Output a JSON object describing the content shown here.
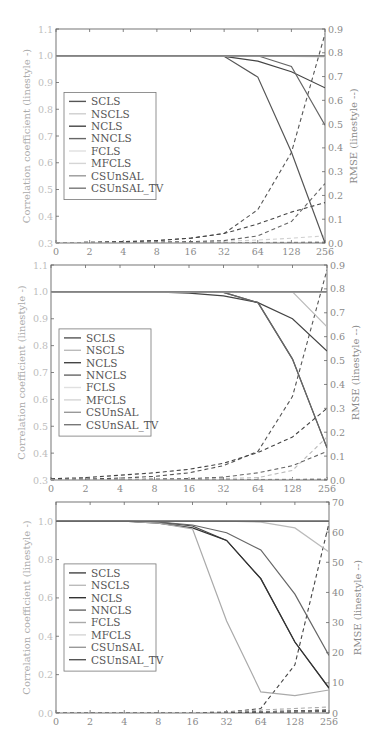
{
  "chart_data": [
    {
      "type": "line",
      "panel": 1,
      "x": [
        "0",
        "2",
        "4",
        "8",
        "16",
        "32",
        "64",
        "128",
        "256"
      ],
      "xlabel": "",
      "ylabel": "Correlation coefficient (linestyle -)",
      "ylim": [
        0.3,
        1.1
      ],
      "yticks": [
        "0.3",
        "0.4",
        "0.5",
        "0.6",
        "0.7",
        "0.8",
        "0.9",
        "1.0",
        "1.1"
      ],
      "y2label": "RMSE (linestyle --)",
      "y2lim": [
        0.0,
        0.9
      ],
      "y2ticks": [
        "0.0",
        "0.1",
        "0.2",
        "0.3",
        "0.4",
        "0.5",
        "0.6",
        "0.7",
        "0.8",
        "0.9"
      ],
      "legend": [
        "SCLS",
        "NSCLS",
        "NCLS",
        "NNCLS",
        "FCLS",
        "MFCLS",
        "CSUnSAL",
        "CSUnSAL_TV"
      ],
      "legend_position": "left-middle",
      "grid": false,
      "series": [
        {
          "name": "SCLS",
          "color": "#555555",
          "corr": [
            1.0,
            1.0,
            1.0,
            1.0,
            1.0,
            0.998,
            0.92,
            0.64,
            0.3
          ],
          "rmse": [
            0.001,
            0.003,
            0.006,
            0.01,
            0.02,
            0.04,
            0.14,
            0.38,
            0.88
          ]
        },
        {
          "name": "NSCLS",
          "color": "#cfcfcf",
          "corr": [
            1.0,
            1.0,
            1.0,
            1.0,
            1.0,
            1.0,
            1.0,
            0.998,
            0.996
          ],
          "rmse": [
            0.0,
            0.0,
            0.001,
            0.002,
            0.004,
            0.008,
            0.012,
            0.02,
            0.03
          ]
        },
        {
          "name": "NCLS",
          "color": "#444444",
          "corr": [
            1.0,
            1.0,
            1.0,
            1.0,
            1.0,
            0.998,
            0.98,
            0.94,
            0.88
          ],
          "rmse": [
            0.001,
            0.003,
            0.005,
            0.01,
            0.02,
            0.04,
            0.08,
            0.13,
            0.17
          ]
        },
        {
          "name": "NNCLS",
          "color": "#666666",
          "corr": [
            1.0,
            1.0,
            1.0,
            1.0,
            1.0,
            1.0,
            1.0,
            0.96,
            0.74
          ],
          "rmse": [
            0.0,
            0.001,
            0.002,
            0.004,
            0.006,
            0.01,
            0.03,
            0.09,
            0.25
          ]
        },
        {
          "name": "FCLS",
          "color": "#e0e0e0",
          "corr": [
            1.0,
            1.0,
            1.0,
            1.0,
            1.0,
            1.0,
            1.0,
            1.0,
            1.0
          ],
          "rmse": [
            0.0,
            0.0,
            0.0,
            0.001,
            0.001,
            0.002,
            0.003,
            0.004,
            0.005
          ]
        },
        {
          "name": "MFCLS",
          "color": "#d5d5d5",
          "corr": [
            1.0,
            1.0,
            1.0,
            1.0,
            1.0,
            1.0,
            1.0,
            1.0,
            1.0
          ],
          "rmse": [
            0.0,
            0.0,
            0.0,
            0.0,
            0.001,
            0.001,
            0.002,
            0.003,
            0.004
          ]
        },
        {
          "name": "CSUnSAL",
          "color": "#999999",
          "corr": [
            1.0,
            1.0,
            1.0,
            1.0,
            1.0,
            1.0,
            1.0,
            1.0,
            1.0
          ],
          "rmse": [
            0.0,
            0.0,
            0.0,
            0.0,
            0.0,
            0.001,
            0.001,
            0.002,
            0.003
          ]
        },
        {
          "name": "CSUnSAL_TV",
          "color": "#777777",
          "corr": [
            1.0,
            1.0,
            1.0,
            1.0,
            1.0,
            1.0,
            1.0,
            1.0,
            1.0
          ],
          "rmse": [
            0.0,
            0.0,
            0.0,
            0.0,
            0.0,
            0.0,
            0.001,
            0.001,
            0.002
          ]
        }
      ]
    },
    {
      "type": "line",
      "panel": 2,
      "x": [
        "0",
        "2",
        "4",
        "8",
        "16",
        "32",
        "64",
        "128",
        "256"
      ],
      "xlabel": "",
      "ylabel": "Correlation coefficient (linestyle -)",
      "ylim": [
        0.3,
        1.1
      ],
      "yticks": [
        "0.3",
        "0.4",
        "0.5",
        "0.6",
        "0.7",
        "0.8",
        "0.9",
        "1.0",
        "1.1"
      ],
      "y2label": "RMSE (linestyle --)",
      "y2lim": [
        0.0,
        0.9
      ],
      "y2ticks": [
        "0.0",
        "0.1",
        "0.2",
        "0.3",
        "0.4",
        "0.5",
        "0.6",
        "0.7",
        "0.8",
        "0.9"
      ],
      "legend": [
        "SCLS",
        "NSCLS",
        "NCLS",
        "NNCLS",
        "FCLS",
        "MFCLS",
        "CSUnSAL",
        "CSUnSAL_TV"
      ],
      "legend_position": "left-middle",
      "grid": false,
      "series": [
        {
          "name": "SCLS",
          "color": "#555555",
          "corr": [
            1.0,
            1.0,
            1.0,
            1.0,
            1.0,
            0.998,
            0.96,
            0.75,
            0.42
          ],
          "rmse": [
            0.002,
            0.004,
            0.008,
            0.015,
            0.03,
            0.06,
            0.12,
            0.35,
            0.88
          ]
        },
        {
          "name": "NSCLS",
          "color": "#bbbbbb",
          "corr": [
            1.0,
            1.0,
            1.0,
            1.0,
            1.0,
            1.0,
            1.0,
            1.0,
            0.87
          ],
          "rmse": [
            0.0,
            0.0,
            0.001,
            0.002,
            0.004,
            0.006,
            0.01,
            0.04,
            0.18
          ]
        },
        {
          "name": "NCLS",
          "color": "#444444",
          "corr": [
            1.0,
            1.0,
            1.0,
            1.0,
            0.995,
            0.985,
            0.96,
            0.9,
            0.78
          ],
          "rmse": [
            0.005,
            0.01,
            0.02,
            0.03,
            0.045,
            0.07,
            0.115,
            0.18,
            0.3
          ]
        },
        {
          "name": "NNCLS",
          "color": "#666666",
          "corr": [
            1.0,
            1.0,
            1.0,
            1.0,
            1.0,
            0.998,
            0.96,
            0.75,
            0.42
          ],
          "rmse": [
            0.0,
            0.001,
            0.002,
            0.004,
            0.006,
            0.012,
            0.03,
            0.06,
            0.12
          ]
        },
        {
          "name": "FCLS",
          "color": "#e0e0e0",
          "corr": [
            1.0,
            1.0,
            1.0,
            1.0,
            1.0,
            1.0,
            1.0,
            1.0,
            1.0
          ],
          "rmse": [
            0.0,
            0.0,
            0.0,
            0.001,
            0.001,
            0.002,
            0.003,
            0.004,
            0.005
          ]
        },
        {
          "name": "MFCLS",
          "color": "#d5d5d5",
          "corr": [
            1.0,
            1.0,
            1.0,
            1.0,
            1.0,
            1.0,
            1.0,
            1.0,
            1.0
          ],
          "rmse": [
            0.0,
            0.0,
            0.0,
            0.0,
            0.001,
            0.001,
            0.002,
            0.003,
            0.004
          ]
        },
        {
          "name": "CSUnSAL",
          "color": "#999999",
          "corr": [
            1.0,
            1.0,
            1.0,
            1.0,
            1.0,
            1.0,
            1.0,
            1.0,
            1.0
          ],
          "rmse": [
            0.0,
            0.0,
            0.0,
            0.0,
            0.0,
            0.001,
            0.001,
            0.002,
            0.003
          ]
        },
        {
          "name": "CSUnSAL_TV",
          "color": "#777777",
          "corr": [
            1.0,
            1.0,
            1.0,
            1.0,
            1.0,
            1.0,
            1.0,
            1.0,
            1.0
          ],
          "rmse": [
            0.0,
            0.0,
            0.0,
            0.0,
            0.0,
            0.0,
            0.001,
            0.001,
            0.002
          ]
        }
      ]
    },
    {
      "type": "line",
      "panel": 3,
      "x": [
        "0",
        "2",
        "4",
        "8",
        "16",
        "32",
        "64",
        "128",
        "256"
      ],
      "xlabel": "",
      "ylabel": "Correlation coefficient (linestyle -)",
      "ylim": [
        0.0,
        1.1
      ],
      "yticks": [
        "0.0",
        "0.2",
        "0.4",
        "0.6",
        "0.8",
        "1.0"
      ],
      "y2label": "RMSE (linestyle --)",
      "y2lim": [
        0,
        70
      ],
      "y2ticks": [
        "0",
        "10",
        "20",
        "30",
        "40",
        "50",
        "60",
        "70"
      ],
      "legend": [
        "SCLS",
        "NSCLS",
        "NCLS",
        "NNCLS",
        "FCLS",
        "MFCLS",
        "CSUnSAL",
        "CSUnSAL_TV"
      ],
      "legend_position": "left-middle",
      "grid": false,
      "series": [
        {
          "name": "SCLS",
          "color": "#444444",
          "corr": [
            1.0,
            1.0,
            1.0,
            0.995,
            0.975,
            0.9,
            0.7,
            0.37,
            0.13
          ],
          "rmse": [
            0.0,
            0.0,
            0.0,
            0.0,
            0.1,
            0.3,
            1.5,
            16.0,
            63.0
          ]
        },
        {
          "name": "NSCLS",
          "color": "#bbbbbb",
          "corr": [
            1.0,
            1.0,
            1.0,
            1.0,
            1.0,
            1.0,
            0.995,
            0.965,
            0.84
          ],
          "rmse": [
            0.0,
            0.0,
            0.0,
            0.0,
            0.0,
            0.1,
            0.3,
            0.5,
            0.8
          ]
        },
        {
          "name": "NCLS",
          "color": "#333333",
          "corr": [
            1.0,
            1.0,
            1.0,
            0.99,
            0.965,
            0.9,
            0.7,
            0.37,
            0.13
          ],
          "rmse": [
            0.0,
            0.0,
            0.0,
            0.0,
            0.1,
            0.2,
            0.4,
            0.7,
            1.0
          ]
        },
        {
          "name": "NNCLS",
          "color": "#666666",
          "corr": [
            1.0,
            1.0,
            1.0,
            0.995,
            0.98,
            0.94,
            0.85,
            0.62,
            0.3
          ],
          "rmse": [
            0.0,
            0.0,
            0.0,
            0.0,
            0.1,
            0.2,
            0.4,
            0.7,
            1.0
          ]
        },
        {
          "name": "FCLS",
          "color": "#aaaaaa",
          "corr": [
            1.0,
            1.0,
            1.0,
            0.99,
            0.96,
            0.48,
            0.11,
            0.09,
            0.12
          ],
          "rmse": [
            0.0,
            0.0,
            0.0,
            0.0,
            0.1,
            0.3,
            1.0,
            1.5,
            2.0
          ]
        },
        {
          "name": "MFCLS",
          "color": "#d5d5d5",
          "corr": [
            1.0,
            1.0,
            1.0,
            1.0,
            1.0,
            1.0,
            1.0,
            1.0,
            1.0
          ],
          "rmse": [
            0.0,
            0.0,
            0.0,
            0.0,
            0.0,
            0.1,
            0.2,
            0.3,
            0.4
          ]
        },
        {
          "name": "CSUnSAL",
          "color": "#999999",
          "corr": [
            1.0,
            1.0,
            1.0,
            1.0,
            1.0,
            1.0,
            1.0,
            1.0,
            1.0
          ],
          "rmse": [
            0.0,
            0.0,
            0.0,
            0.0,
            0.0,
            0.1,
            0.2,
            0.3,
            0.4
          ]
        },
        {
          "name": "CSUnSAL_TV",
          "color": "#555555",
          "corr": [
            1.0,
            1.0,
            1.0,
            1.0,
            1.0,
            1.0,
            1.0,
            1.0,
            1.0
          ],
          "rmse": [
            0.0,
            0.0,
            0.0,
            0.0,
            0.0,
            0.1,
            0.2,
            0.3,
            0.5
          ]
        }
      ]
    }
  ],
  "layout": {
    "panels": [
      {
        "left": 56,
        "right": 325,
        "top": 29,
        "bottom": 243
      },
      {
        "left": 51,
        "right": 327,
        "top": 265,
        "bottom": 480
      },
      {
        "left": 56,
        "right": 329,
        "top": 502,
        "bottom": 713
      }
    ]
  }
}
